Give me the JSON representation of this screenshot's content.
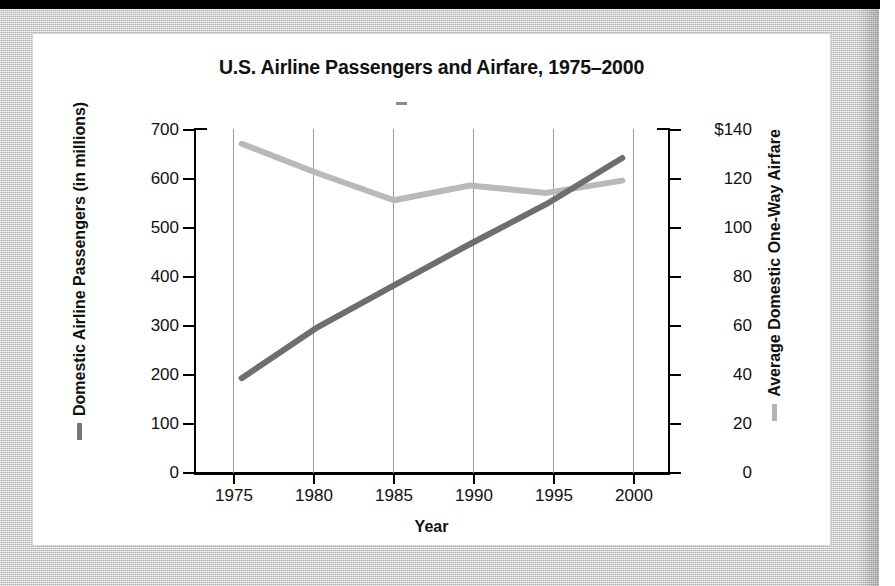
{
  "page": {
    "background_color": "#cdcdcd",
    "card_background": "#ffffff",
    "top_bar_color": "#000000"
  },
  "chart": {
    "title": "U.S. Airline Passengers and Airfare, 1975–2000",
    "x_axis_title": "Year",
    "y_left_title": "Domestic Airline Passengers (in millions)",
    "y_right_title": "Average Domestic One-Way Airfare",
    "passengers_color": "#6e6e6e",
    "airfare_color": "#b9b9b9",
    "gridline_color": "#9a9a9a",
    "axis_color": "#000000"
  },
  "chart_data": {
    "type": "line",
    "title": "U.S. Airline Passengers and Airfare, 1975–2000",
    "xlabel": "Year",
    "ylabel": "Domestic Airline Passengers (in millions)",
    "y2label": "Average Domestic One-Way Airfare",
    "x": [
      1975,
      1980,
      1985,
      1990,
      1995,
      2000
    ],
    "x_tick_labels": [
      "1975",
      "1980",
      "1985",
      "1990",
      "1995",
      "2000"
    ],
    "xlim": [
      1972,
      2003
    ],
    "ylim": [
      0,
      700
    ],
    "y2lim": [
      0,
      140
    ],
    "y_tick_labels": [
      "0",
      "100",
      "200",
      "300",
      "400",
      "500",
      "600",
      "700"
    ],
    "y_ticks": [
      0,
      100,
      200,
      300,
      400,
      500,
      600,
      700
    ],
    "y2_tick_labels": [
      "0",
      "20",
      "40",
      "60",
      "80",
      "100",
      "120",
      "$140"
    ],
    "y2_ticks": [
      0,
      20,
      40,
      60,
      80,
      100,
      120,
      140
    ],
    "grid": "vertical-only",
    "legend_position": "axis-titles",
    "series": [
      {
        "name": "Domestic Airline Passengers (in millions)",
        "axis": "left",
        "color": "#6e6e6e",
        "values": [
          193,
          297,
          382,
          466,
          547,
          641
        ]
      },
      {
        "name": "Average Domestic One-Way Airfare",
        "axis": "right",
        "color": "#b9b9b9",
        "values": [
          134,
          122,
          111,
          117,
          114,
          119
        ]
      }
    ]
  },
  "y_left_labels": [
    "700",
    "600",
    "500",
    "400",
    "300",
    "200",
    "100",
    "0"
  ],
  "y_right_labels": [
    "$140",
    "120",
    "100",
    "80",
    "60",
    "40",
    "20",
    "0"
  ],
  "x_labels": [
    "1975",
    "1980",
    "1985",
    "1990",
    "1995",
    "2000"
  ]
}
